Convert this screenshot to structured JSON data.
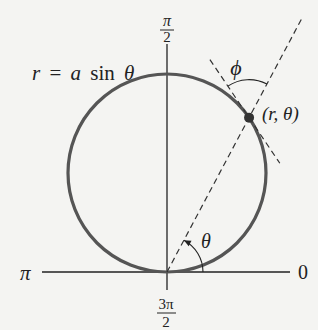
{
  "diagram": {
    "curve_label": {
      "lhs": "r",
      "eq": "=",
      "a": "a",
      "fn": "sin",
      "theta": "θ"
    },
    "point_label": "(r, θ)",
    "angle_phi_label": "ϕ",
    "angle_theta_label": "θ",
    "axis_labels": {
      "right": "0",
      "left": "π",
      "top_num": "π",
      "top_den": "2",
      "bottom_num": "3π",
      "bottom_den": "2"
    },
    "point_theta_deg": 62,
    "colors": {
      "curve": "#555555",
      "axis": "#222222",
      "dash": "#333333",
      "background": "#f4f4f2"
    }
  }
}
